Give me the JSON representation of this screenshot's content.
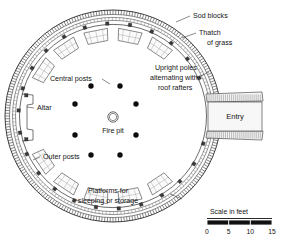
{
  "figure": {
    "background_color": "#ffffff",
    "ink_color": "#141414"
  },
  "labels": {
    "sod_blocks": "Sod blocks",
    "thatch_line1": "Thatch",
    "thatch_line2": "of grass",
    "upright_line1": "Upright poles",
    "upright_line2": "alternating with",
    "upright_line3": "roof rafters",
    "central_posts": "Central posts",
    "altar": "Altar",
    "outer_posts": "Outer posts",
    "fire_pit": "Fire pit",
    "entry": "Entry",
    "platforms_line1": "Platforms for",
    "platforms_line2": "sleeping or storage"
  },
  "scale": {
    "caption": "Scale in feet",
    "ticks": [
      "0",
      "5",
      "10",
      "15"
    ],
    "units": "feet",
    "min": 0,
    "max": 15
  },
  "plan": {
    "center": {
      "x": 113,
      "y": 116
    },
    "lodge_radius_x": 108,
    "lodge_radius_y": 106,
    "fire_pit": {
      "x": 113,
      "y": 117,
      "r_outer": 5.2,
      "r_inner": 3.6
    },
    "central_posts": [
      {
        "x": 91,
        "y": 86
      },
      {
        "x": 120,
        "y": 86
      },
      {
        "x": 75,
        "y": 104
      },
      {
        "x": 136,
        "y": 104
      },
      {
        "x": 75,
        "y": 135
      },
      {
        "x": 136,
        "y": 135
      },
      {
        "x": 91,
        "y": 155
      },
      {
        "x": 120,
        "y": 155
      }
    ],
    "outer_post_count": 26,
    "platform_count": 16,
    "entry": {
      "x": 228,
      "y": 99,
      "width": 31,
      "height": 35
    }
  }
}
